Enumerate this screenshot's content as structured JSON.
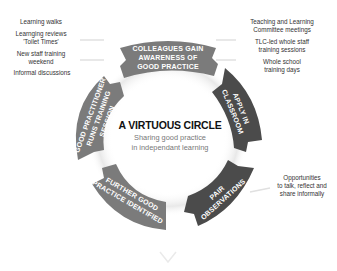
{
  "diagram": {
    "title": "A VIRTUOUS CIRCLE",
    "subtitle_line1": "Sharing good practice",
    "subtitle_line2": "in independant learning",
    "colors": {
      "light_segment": "#7b7b7b",
      "dark_segment": "#4b4b4b",
      "background": "#ffffff"
    },
    "segments": [
      {
        "lines": [
          "COLLEAGUES GAIN",
          "AWARENESS OF",
          "GOOD PRACTICE"
        ]
      },
      {
        "lines": [
          "APPLY IN",
          "CLASSROOM"
        ]
      },
      {
        "lines": [
          "PAIR",
          "OBSERVATIONS"
        ]
      },
      {
        "lines": [
          "FURTHER GOOD",
          "PRACTICE IDENTIFIED"
        ]
      },
      {
        "lines": [
          "GOOD PRACTITIONER",
          "RUNS TRAINING",
          "SESSION"
        ]
      }
    ],
    "left_notes": [
      "Learning walks",
      "Learnging reviews",
      "'Toilet Times'",
      "New staff training",
      "weekend",
      "Informal discussions"
    ],
    "right_notes": [
      "Teaching and Learning",
      "Committee meetings",
      "TLC-led whole staff",
      "training sessions",
      "Whole school",
      "training days"
    ],
    "bottom_right_notes": [
      "Opportunities",
      "to talk, reflect and",
      "share informally"
    ]
  }
}
